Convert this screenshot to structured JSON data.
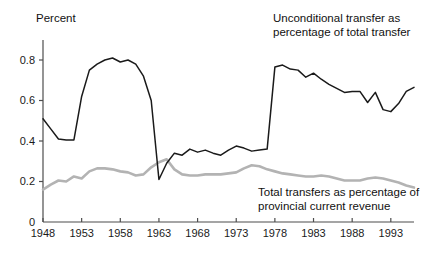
{
  "chart_data": {
    "type": "line",
    "title": "",
    "xlabel": "",
    "ylabel": "Percent",
    "xlim": [
      1948,
      1996
    ],
    "ylim": [
      0,
      0.9
    ],
    "grid": false,
    "legend_position": "inline-annotations",
    "xticks": [
      1948,
      1953,
      1958,
      1963,
      1968,
      1973,
      1978,
      1983,
      1988,
      1993
    ],
    "xtick_labels": [
      "1948",
      "1953",
      "1958",
      "1963",
      "1968",
      "1973",
      "1978",
      "1983",
      "1988",
      "1993"
    ],
    "yticks": [
      0,
      0.2,
      0.4,
      0.6,
      0.8
    ],
    "ytick_labels": [
      "0",
      "0.2",
      "0.4",
      "0.6",
      "0.8"
    ],
    "x": [
      1948,
      1949,
      1950,
      1951,
      1952,
      1953,
      1954,
      1955,
      1956,
      1957,
      1958,
      1959,
      1960,
      1961,
      1962,
      1963,
      1964,
      1965,
      1966,
      1967,
      1968,
      1969,
      1970,
      1971,
      1972,
      1973,
      1974,
      1975,
      1976,
      1977,
      1978,
      1979,
      1980,
      1981,
      1982,
      1983,
      1984,
      1985,
      1986,
      1987,
      1988,
      1989,
      1990,
      1991,
      1992,
      1993,
      1994,
      1995,
      1996
    ],
    "series": [
      {
        "name": "Unconditional transfer as percentage of total transfer",
        "color": "#1a1a1a",
        "values": [
          0.51,
          0.46,
          0.41,
          0.405,
          0.405,
          0.62,
          0.75,
          0.78,
          0.8,
          0.81,
          0.79,
          0.8,
          0.78,
          0.72,
          0.6,
          0.21,
          0.29,
          0.34,
          0.33,
          0.36,
          0.345,
          0.355,
          0.34,
          0.33,
          0.355,
          0.375,
          0.365,
          0.35,
          0.355,
          0.36,
          0.765,
          0.775,
          0.755,
          0.75,
          0.715,
          0.735,
          0.705,
          0.68,
          0.66,
          0.64,
          0.645,
          0.645,
          0.59,
          0.64,
          0.555,
          0.545,
          0.585,
          0.645,
          0.665
        ]
      },
      {
        "name": "Total transfers as percentage of provincial current revenue",
        "color": "#b3b3b3",
        "values": [
          0.16,
          0.185,
          0.205,
          0.2,
          0.225,
          0.215,
          0.25,
          0.265,
          0.265,
          0.26,
          0.25,
          0.245,
          0.23,
          0.235,
          0.27,
          0.295,
          0.31,
          0.26,
          0.235,
          0.23,
          0.23,
          0.235,
          0.235,
          0.235,
          0.24,
          0.245,
          0.265,
          0.28,
          0.275,
          0.26,
          0.25,
          0.24,
          0.235,
          0.23,
          0.225,
          0.225,
          0.23,
          0.225,
          0.215,
          0.205,
          0.205,
          0.205,
          0.215,
          0.22,
          0.215,
          0.205,
          0.195,
          0.18,
          0.17
        ]
      }
    ],
    "annotations": [
      {
        "name": "unconditional-transfer-label",
        "lines": [
          "Unconditional transfer as",
          "percentage of total transfer"
        ],
        "x": 273,
        "y": 22
      },
      {
        "name": "total-transfers-label",
        "lines": [
          "Total transfers as percentage of",
          "provincial current revenue"
        ],
        "x": 258,
        "y": 196
      }
    ]
  }
}
